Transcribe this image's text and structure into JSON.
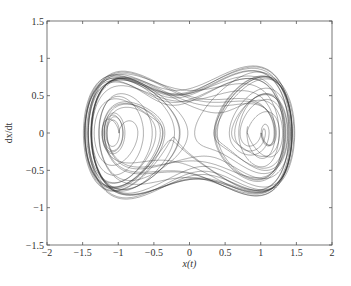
{
  "chart_data": {
    "type": "line",
    "title": "",
    "xlabel": "x(t)",
    "ylabel": "dx/dt",
    "xlim": [
      -2,
      2
    ],
    "ylim": [
      -1.5,
      1.5
    ],
    "xticks": [
      -2,
      -1.5,
      -1,
      -0.5,
      0,
      0.5,
      1,
      1.5,
      2
    ],
    "xtick_labels": [
      "-2",
      "-1.5",
      "-1",
      "-0.5",
      "0",
      "0.5",
      "1",
      "1.5",
      "2"
    ],
    "yticks": [
      -1.5,
      -1,
      -0.5,
      0,
      0.5,
      1,
      1.5
    ],
    "ytick_labels": [
      "-1.5",
      "-1",
      "-0.5",
      "0",
      "0.5",
      "1",
      "1.5"
    ],
    "grid": false,
    "legend": null,
    "series": [
      {
        "name": "phase trajectory (x, dx/dt)",
        "description": "Chaotic forced double-well (Duffing-type) trajectory; two spiral foci near (-0.9, 0) and (0.9, 0); outer envelope x in approx [-1.55, 1.55], dx/dt in approx [-1.3, 1.3]",
        "model": {
          "delta": 0.18,
          "alpha": -1.0,
          "beta": 1.0,
          "gamma": 0.28,
          "omega": 1.0
        },
        "key_points": [
          {
            "x": -0.9,
            "y": 0.0,
            "note": "left spiral center"
          },
          {
            "x": 0.9,
            "y": 0.0,
            "note": "right spiral center"
          },
          {
            "x": -1.55,
            "y": 0.0,
            "note": "leftmost envelope"
          },
          {
            "x": 1.55,
            "y": 0.0,
            "note": "rightmost envelope"
          },
          {
            "x": -1.0,
            "y": 1.2,
            "note": "top-left lobe"
          },
          {
            "x": 1.0,
            "y": 1.25,
            "note": "top-right lobe"
          },
          {
            "x": -1.0,
            "y": -1.25,
            "note": "bottom-left lobe"
          },
          {
            "x": 1.0,
            "y": -1.2,
            "note": "bottom-right lobe"
          },
          {
            "x": 0.0,
            "y": 1.0,
            "note": "top waist"
          },
          {
            "x": 0.0,
            "y": -1.0,
            "note": "bottom waist"
          }
        ],
        "color": "#2a2a2a"
      }
    ]
  },
  "style": {
    "axis_color": "#555555",
    "line_color": "#2a2a2a",
    "background": "#ffffff"
  }
}
